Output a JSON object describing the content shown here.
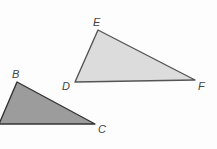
{
  "diagram": {
    "triangles": [
      {
        "id": "DEF",
        "fill": "#dcdcdc",
        "stroke": "#555555",
        "vertices": [
          {
            "name": "D",
            "x": 75,
            "y": 82,
            "label_x": 62,
            "label_y": 81
          },
          {
            "name": "E",
            "x": 98,
            "y": 30,
            "label_x": 93,
            "label_y": 17
          },
          {
            "name": "F",
            "x": 195,
            "y": 80,
            "label_x": 198,
            "label_y": 81
          }
        ]
      },
      {
        "id": "ABC",
        "fill": "#9c9c9c",
        "stroke": "#333333",
        "vertices": [
          {
            "name": "A",
            "x": -1,
            "y": 124,
            "label_x": null,
            "label_y": null
          },
          {
            "name": "B",
            "x": 17,
            "y": 82,
            "label_x": 12,
            "label_y": 69
          },
          {
            "name": "C",
            "x": 95,
            "y": 124,
            "label_x": 98,
            "label_y": 124
          }
        ]
      }
    ],
    "labels": {
      "B": "B",
      "C": "C",
      "D": "D",
      "E": "E",
      "F": "F"
    }
  }
}
